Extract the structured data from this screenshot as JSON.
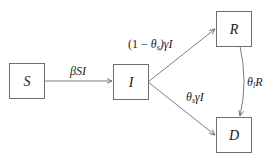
{
  "diagram": {
    "type": "compartmental-flow",
    "colors": {
      "stroke": "#6e6e6e",
      "text": "#1a1a1a",
      "background": "#ffffff"
    },
    "nodes": [
      {
        "id": "S",
        "label": "S"
      },
      {
        "id": "I",
        "label": "I"
      },
      {
        "id": "R",
        "label": "R"
      },
      {
        "id": "D",
        "label": "D"
      }
    ],
    "edges": [
      {
        "from": "S",
        "to": "I",
        "label": "βSI"
      },
      {
        "from": "I",
        "to": "R",
        "label": "(1 − θs)γI",
        "parts": {
          "open": "(1 − ",
          "theta": "θ",
          "sub": "s",
          "close": ")γI"
        }
      },
      {
        "from": "I",
        "to": "D",
        "label": "θsγI",
        "parts": {
          "theta": "θ",
          "sub": "s",
          "rest": "γI"
        }
      },
      {
        "from": "R",
        "to": "D",
        "label": "θlR",
        "parts": {
          "theta": "θ",
          "sub": "l",
          "rest": "R"
        }
      }
    ]
  }
}
